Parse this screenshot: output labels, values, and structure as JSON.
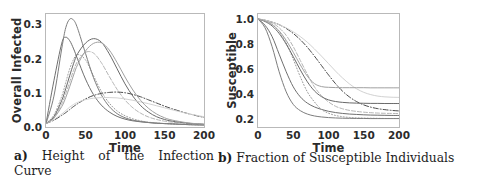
{
  "figure": {
    "panel_a": {
      "caption_marker": "a)",
      "caption_text": "Height of the Infection Curve"
    },
    "panel_b": {
      "caption_marker": "b)",
      "caption_text": "Fraction of Susceptible Individuals"
    }
  },
  "legend": {
    "title": "State",
    "entries": [
      {
        "label": "BA",
        "color": "#6f6f6f",
        "dash": "none"
      },
      {
        "label": "ER",
        "color": "#9a9a9a",
        "dash": "1,2"
      },
      {
        "label": "GN",
        "color": "#7d7d7d",
        "dash": "none"
      },
      {
        "label": "HH",
        "color": "#b4b4b4",
        "dash": "4,2"
      },
      {
        "label": "WS",
        "color": "#4a4a4a",
        "dash": "5,2,1,2"
      },
      {
        "label": "CM-PL",
        "color": "#696969",
        "dash": "none"
      },
      {
        "label": "CG",
        "color": "#d2d2d2",
        "dash": "none"
      },
      {
        "label": "ODE",
        "color": "#a0a0a0",
        "dash": "none"
      }
    ]
  },
  "chart_data": [
    {
      "id": "panel-a",
      "type": "line",
      "title": "",
      "xlabel": "Time",
      "ylabel": "Overall Infected",
      "xlim": [
        0,
        200
      ],
      "ylim": [
        0.0,
        0.33
      ],
      "xticks": [
        0,
        50,
        100,
        150,
        200
      ],
      "xticklabels": [
        "0",
        "50",
        "100",
        "150",
        "200"
      ],
      "yticks": [
        0.0,
        0.1,
        0.2,
        0.3
      ],
      "yticklabels": [
        "0.0",
        "0.1",
        "0.2",
        "0.3"
      ],
      "grid": false,
      "legend_position": "outside-right",
      "x": [
        0,
        10,
        20,
        25,
        30,
        35,
        40,
        50,
        60,
        70,
        80,
        90,
        100,
        110,
        120,
        130,
        140,
        150,
        160,
        180,
        200
      ],
      "series": [
        {
          "name": "BA",
          "color": "#6f6f6f",
          "dash": "none",
          "values": [
            0.01,
            0.135,
            0.245,
            0.262,
            0.252,
            0.228,
            0.198,
            0.14,
            0.095,
            0.064,
            0.044,
            0.031,
            0.023,
            0.018,
            0.015,
            0.013,
            0.011,
            0.01,
            0.009,
            0.007,
            0.006
          ]
        },
        {
          "name": "ER",
          "color": "#9a9a9a",
          "dash": "1,2",
          "values": [
            0.01,
            0.035,
            0.09,
            0.13,
            0.17,
            0.198,
            0.212,
            0.196,
            0.15,
            0.104,
            0.07,
            0.047,
            0.033,
            0.024,
            0.018,
            0.014,
            0.012,
            0.01,
            0.009,
            0.007,
            0.006
          ]
        },
        {
          "name": "GN",
          "color": "#7d7d7d",
          "dash": "none",
          "values": [
            0.01,
            0.09,
            0.23,
            0.29,
            0.315,
            0.312,
            0.288,
            0.215,
            0.145,
            0.094,
            0.06,
            0.039,
            0.027,
            0.02,
            0.016,
            0.013,
            0.011,
            0.01,
            0.009,
            0.007,
            0.006
          ]
        },
        {
          "name": "HH",
          "color": "#b4b4b4",
          "dash": "4,2",
          "values": [
            0.01,
            0.028,
            0.068,
            0.098,
            0.132,
            0.166,
            0.192,
            0.218,
            0.216,
            0.188,
            0.148,
            0.11,
            0.079,
            0.056,
            0.04,
            0.029,
            0.022,
            0.017,
            0.014,
            0.01,
            0.008
          ]
        },
        {
          "name": "WS",
          "color": "#4a4a4a",
          "dash": "5,2,1,2",
          "values": [
            0.01,
            0.02,
            0.034,
            0.042,
            0.051,
            0.06,
            0.068,
            0.082,
            0.092,
            0.098,
            0.101,
            0.102,
            0.1,
            0.095,
            0.088,
            0.079,
            0.07,
            0.061,
            0.053,
            0.039,
            0.028
          ]
        },
        {
          "name": "CM-PL",
          "color": "#696969",
          "dash": "none",
          "values": [
            0.01,
            0.03,
            0.078,
            0.112,
            0.15,
            0.186,
            0.214,
            0.245,
            0.258,
            0.248,
            0.214,
            0.17,
            0.126,
            0.09,
            0.062,
            0.043,
            0.03,
            0.022,
            0.017,
            0.011,
            0.008
          ]
        },
        {
          "name": "CG",
          "color": "#d2d2d2",
          "dash": "none",
          "values": [
            0.01,
            0.022,
            0.038,
            0.048,
            0.058,
            0.066,
            0.072,
            0.08,
            0.084,
            0.086,
            0.086,
            0.085,
            0.082,
            0.078,
            0.073,
            0.068,
            0.062,
            0.056,
            0.05,
            0.039,
            0.03
          ]
        },
        {
          "name": "ODE",
          "color": "#a0a0a0",
          "dash": "none",
          "values": [
            0.01,
            0.026,
            0.06,
            0.086,
            0.118,
            0.152,
            0.182,
            0.222,
            0.244,
            0.246,
            0.225,
            0.188,
            0.146,
            0.108,
            0.077,
            0.054,
            0.038,
            0.027,
            0.02,
            0.012,
            0.008
          ]
        }
      ]
    },
    {
      "id": "panel-b",
      "type": "line",
      "title": "",
      "xlabel": "Time",
      "ylabel": "Susceptible",
      "xlim": [
        0,
        200
      ],
      "ylim": [
        0.14,
        1.04
      ],
      "xticks": [
        0,
        50,
        100,
        150,
        200
      ],
      "xticklabels": [
        "0",
        "50",
        "100",
        "150",
        "200"
      ],
      "yticks": [
        0.2,
        0.4,
        0.6,
        0.8,
        1.0
      ],
      "yticklabels": [
        "0.2",
        "0.4",
        "0.6",
        "0.8",
        "1.0"
      ],
      "grid": false,
      "legend_position": "outside-right",
      "x": [
        0,
        10,
        20,
        30,
        40,
        50,
        60,
        70,
        80,
        90,
        100,
        110,
        120,
        130,
        140,
        150,
        160,
        170,
        180,
        190,
        200
      ],
      "series": [
        {
          "name": "BA",
          "color": "#6f6f6f",
          "dash": "none",
          "values": [
            1.0,
            0.95,
            0.86,
            0.72,
            0.58,
            0.46,
            0.38,
            0.33,
            0.3,
            0.28,
            0.265,
            0.255,
            0.248,
            0.243,
            0.24,
            0.237,
            0.235,
            0.234,
            0.233,
            0.232,
            0.232
          ]
        },
        {
          "name": "ER",
          "color": "#9a9a9a",
          "dash": "1,2",
          "values": [
            1.0,
            0.99,
            0.96,
            0.9,
            0.81,
            0.68,
            0.54,
            0.42,
            0.34,
            0.28,
            0.25,
            0.232,
            0.222,
            0.216,
            0.213,
            0.211,
            0.21,
            0.209,
            0.208,
            0.208,
            0.208
          ]
        },
        {
          "name": "GN",
          "color": "#7d7d7d",
          "dash": "none",
          "values": [
            1.0,
            0.93,
            0.78,
            0.58,
            0.42,
            0.32,
            0.27,
            0.243,
            0.228,
            0.22,
            0.215,
            0.212,
            0.21,
            0.209,
            0.208,
            0.208,
            0.207,
            0.207,
            0.207,
            0.207,
            0.207
          ]
        },
        {
          "name": "HH",
          "color": "#b4b4b4",
          "dash": "4,2",
          "values": [
            1.0,
            0.99,
            0.97,
            0.93,
            0.87,
            0.78,
            0.67,
            0.56,
            0.46,
            0.39,
            0.34,
            0.305,
            0.285,
            0.272,
            0.264,
            0.258,
            0.254,
            0.251,
            0.249,
            0.248,
            0.247
          ]
        },
        {
          "name": "WS",
          "color": "#4a4a4a",
          "dash": "5,2,1,2",
          "values": [
            1.0,
            0.99,
            0.975,
            0.955,
            0.925,
            0.885,
            0.835,
            0.775,
            0.705,
            0.63,
            0.555,
            0.485,
            0.425,
            0.378,
            0.342,
            0.316,
            0.298,
            0.286,
            0.278,
            0.272,
            0.268
          ]
        },
        {
          "name": "CM-PL",
          "color": "#696969",
          "dash": "none",
          "values": [
            1.0,
            0.98,
            0.945,
            0.885,
            0.8,
            0.7,
            0.595,
            0.5,
            0.428,
            0.382,
            0.356,
            0.343,
            0.336,
            0.332,
            0.33,
            0.329,
            0.328,
            0.328,
            0.327,
            0.327,
            0.327
          ]
        },
        {
          "name": "CG",
          "color": "#d2d2d2",
          "dash": "none",
          "values": [
            1.0,
            0.99,
            0.975,
            0.955,
            0.93,
            0.898,
            0.86,
            0.815,
            0.762,
            0.705,
            0.645,
            0.585,
            0.53,
            0.482,
            0.444,
            0.416,
            0.398,
            0.386,
            0.38,
            0.377,
            0.376
          ]
        },
        {
          "name": "ODE",
          "color": "#a0a0a0",
          "dash": "none",
          "values": [
            1.0,
            0.985,
            0.955,
            0.905,
            0.83,
            0.735,
            0.635,
            0.545,
            0.486,
            0.462,
            0.456,
            0.454,
            0.453,
            0.453,
            0.453,
            0.453,
            0.452,
            0.452,
            0.452,
            0.452,
            0.452
          ]
        }
      ]
    }
  ]
}
